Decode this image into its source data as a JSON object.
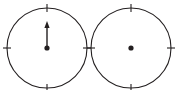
{
  "figure": {
    "background_color": "#ffffff",
    "stroke_color": "#231f20",
    "width": 176,
    "height": 90,
    "dials": [
      {
        "id": "left-dial",
        "label": "left dial with upward vector",
        "center_x": 47,
        "center_y": 48,
        "radius": 40,
        "hub_radius": 2.6,
        "tick_angles_deg": [
          0,
          90,
          180,
          270
        ],
        "tick_inner_offset": 4,
        "tick_outer_offset": 4,
        "has_vector": true,
        "vector": {
          "direction_deg": 90,
          "direction_label": "up",
          "length": 27,
          "head_length": 7,
          "head_half_width": 2.6
        }
      },
      {
        "id": "right-dial",
        "label": "right dial with no vector",
        "center_x": 131,
        "center_y": 48,
        "radius": 40,
        "hub_radius": 2.6,
        "tick_angles_deg": [
          0,
          90,
          180,
          270
        ],
        "tick_inner_offset": 4,
        "tick_outer_offset": 4,
        "has_vector": false,
        "vector": null
      }
    ]
  }
}
